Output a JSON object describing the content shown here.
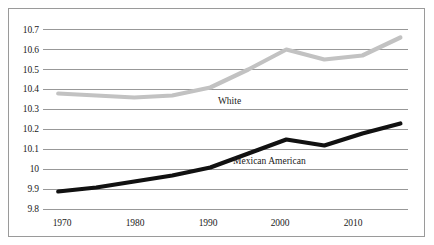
{
  "chart_data": {
    "type": "line",
    "title": "",
    "subtitle": "",
    "xlabel": "",
    "ylabel": "",
    "xlim": [
      1968,
      2016
    ],
    "ylim": [
      9.8,
      10.7
    ],
    "grid": true,
    "grid_axis": "y",
    "legend_position": "inline-annotation",
    "x_ticks": [
      1970,
      1980,
      1990,
      2000,
      2010
    ],
    "x_tick_labels": [
      "1970",
      "1980",
      "1990",
      "2000",
      "2010"
    ],
    "y_ticks": [
      9.8,
      9.9,
      10.0,
      10.1,
      10.2,
      10.3,
      10.4,
      10.5,
      10.6,
      10.7
    ],
    "y_tick_labels": [
      "9.8",
      "9.9",
      "10",
      "10.1",
      "10.2",
      "10.3",
      "10.4",
      "10.5",
      "10.6",
      "10.7"
    ],
    "x": [
      1970,
      1975,
      1980,
      1985,
      1990,
      1995,
      2000,
      2005,
      2010,
      2015
    ],
    "series": [
      {
        "name": "White",
        "color": "#c2c2c2",
        "values": [
          10.38,
          10.37,
          10.36,
          10.37,
          10.41,
          10.5,
          10.6,
          10.55,
          10.57,
          10.66
        ],
        "label_text": "White",
        "label_x": 1991,
        "label_y": 10.345
      },
      {
        "name": "Mexican American",
        "color": "#111111",
        "values": [
          9.89,
          9.91,
          9.94,
          9.97,
          10.01,
          10.08,
          10.15,
          10.12,
          10.18,
          10.23
        ],
        "label_text": "Mexican American",
        "label_x": 1993,
        "label_y": 10.045
      }
    ]
  },
  "axes": {
    "y_labels": [
      "10.7",
      "10.6",
      "10.5",
      "10.4",
      "10.3",
      "10.2",
      "10.1",
      "10",
      "9.9",
      "9.8"
    ],
    "x_labels": [
      "1970",
      "1980",
      "1990",
      "2000",
      "2010"
    ]
  },
  "annotations": {
    "white_label": "White",
    "mexican_american_label": "Mexican American"
  },
  "colors": {
    "white_series": "#c2c2c2",
    "mexican_american_series": "#111111",
    "gridline": "#8c8c8c",
    "border": "#9a9a9a",
    "background": "#ffffff",
    "text": "#1a1a1a"
  }
}
